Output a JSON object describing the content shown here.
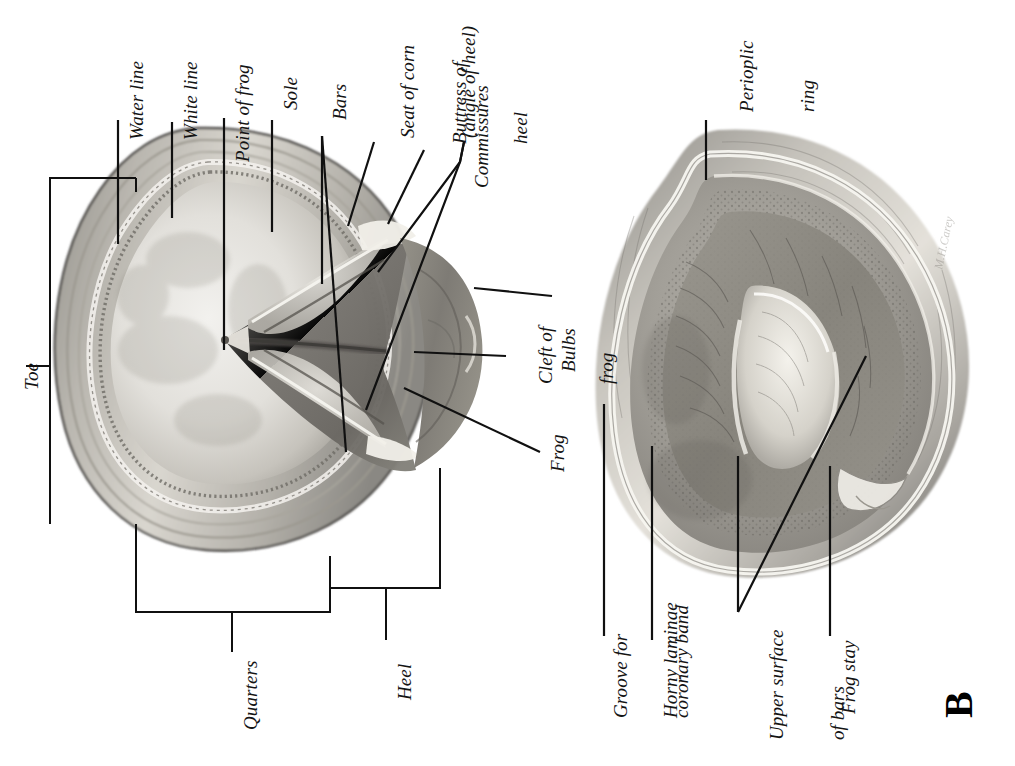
{
  "figure": {
    "type": "anatomical-illustration",
    "orientation": "rotated 90 degrees counter-clockwise",
    "background_color": "#ffffff",
    "ink_color": "#101010"
  },
  "panels": [
    {
      "id": "A",
      "letter": "",
      "name": "solar-surface-view"
    },
    {
      "id": "B",
      "letter": "B",
      "name": "inner-surface-view"
    }
  ],
  "panel_a": {
    "labels": [
      {
        "id": "water-line",
        "text": "Water line"
      },
      {
        "id": "white-line",
        "text": "White line"
      },
      {
        "id": "point-of-frog",
        "text": "Point of frog"
      },
      {
        "id": "sole",
        "text": "Sole"
      },
      {
        "id": "bars",
        "text": "Bars"
      },
      {
        "id": "seat-of-corn",
        "text": "Seat of corn",
        "text2": "(angle of heel)"
      },
      {
        "id": "buttress-of-heel",
        "text": "Buttress of",
        "text2": "heel"
      },
      {
        "id": "commissures",
        "text": "Commissures"
      },
      {
        "id": "cleft-of-frog",
        "text": "Cleft of",
        "text2": "frog"
      },
      {
        "id": "bulbs",
        "text": "Bulbs"
      },
      {
        "id": "frog",
        "text": "Frog"
      },
      {
        "id": "toe",
        "text": "Toe"
      },
      {
        "id": "quarters",
        "text": "Quarters"
      },
      {
        "id": "heel",
        "text": "Heel"
      }
    ]
  },
  "panel_b": {
    "letter": "B",
    "labels": [
      {
        "id": "perioplic-ring",
        "text": "Perioplic",
        "text2": "ring"
      },
      {
        "id": "groove-coronary-band",
        "text": "Groove for",
        "text2": "coronary band"
      },
      {
        "id": "horny-laminae",
        "text": "Horny laminae"
      },
      {
        "id": "upper-surface-bars",
        "text": "Upper surface",
        "text2": "of bars"
      },
      {
        "id": "frog-stay",
        "text": "Frog stay"
      }
    ],
    "signature": "M.H.Carey"
  }
}
